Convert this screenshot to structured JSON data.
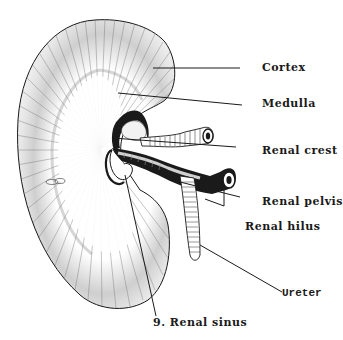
{
  "figure": {
    "background": "#ffffff",
    "ink": "#1a1a1a"
  },
  "labels": {
    "cortex": "Cortex",
    "medulla": "Medulla",
    "renal_crest": "Renal crest",
    "renal_pelvis": "Renal pelvis",
    "renal_hilus": "Renal hilus",
    "ureter": "Ureter",
    "renal_sinus": "9. Renal sinus"
  }
}
